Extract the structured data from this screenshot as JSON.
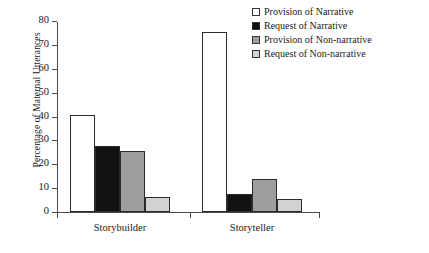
{
  "chart_data": {
    "type": "bar",
    "title": "",
    "subtitle": "",
    "xlabel": "",
    "ylabel": "Percentage of Maternal Utterances",
    "categories": [
      "Storybuilder",
      "Storyteller"
    ],
    "series": [
      {
        "name": "Provision of Narrative",
        "color": "#ffffff",
        "values": [
          40.5,
          75.5
        ]
      },
      {
        "name": "Request of Narrative",
        "color": "#111111",
        "values": [
          27.5,
          7.5
        ]
      },
      {
        "name": "Provision of Non-narrative",
        "color": "#9e9e9e",
        "values": [
          25.5,
          14.0
        ]
      },
      {
        "name": "Request of Non-narrative",
        "color": "#d2d2d2",
        "values": [
          6.3,
          5.5
        ]
      }
    ],
    "ylim": [
      0,
      80
    ],
    "yticks": [
      0,
      10,
      20,
      30,
      40,
      50,
      60,
      70,
      80
    ],
    "ytick_labels": [
      "0",
      "10",
      "20",
      "30",
      "40",
      "50",
      "60",
      "70",
      "80"
    ],
    "grid": false,
    "legend_position": "top-right",
    "bar_border_color": "#2b2b2b",
    "axis_color": "#4a4a4a"
  }
}
